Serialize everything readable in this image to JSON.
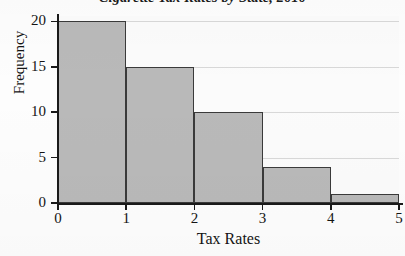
{
  "chart_data": {
    "type": "bar",
    "title": "Cigarette Tax Rates by State, 2010",
    "xlabel": "Tax Rates",
    "ylabel": "Frequency",
    "categories": [
      "0-1",
      "1-2",
      "2-3",
      "3-4",
      "4-5"
    ],
    "bin_edges": [
      0,
      1,
      2,
      3,
      4,
      5
    ],
    "values": [
      20,
      15,
      10,
      4,
      1
    ],
    "xlim": [
      0,
      5
    ],
    "ylim": [
      0,
      20.6
    ],
    "x_ticks": [
      "0",
      "1",
      "2",
      "3",
      "4",
      "5"
    ],
    "y_ticks": [
      "0",
      "5",
      "10",
      "15",
      "20"
    ],
    "grid": true,
    "legend": null,
    "colors": {
      "bar_fill": "#b9b9b9",
      "bar_edge": "#3a3a3a",
      "axis": "#1a1a1a",
      "gridline": "#d8d8d8",
      "plot_background": "#fbfbfb",
      "text": "#141414"
    }
  }
}
